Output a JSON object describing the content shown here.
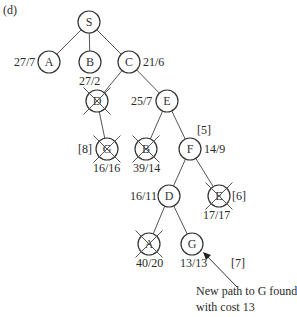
{
  "panel_label": "(d)",
  "nodes": [
    {
      "id": "S",
      "letter": "S",
      "x": 89,
      "y": 22,
      "crossed": false,
      "label": ""
    },
    {
      "id": "A1",
      "letter": "A",
      "x": 49,
      "y": 62,
      "crossed": false,
      "label": "27/7"
    },
    {
      "id": "B1",
      "letter": "B",
      "x": 90,
      "y": 62,
      "crossed": false,
      "label": "27/2"
    },
    {
      "id": "C1",
      "letter": "C",
      "x": 129,
      "y": 62,
      "crossed": false,
      "label": "21/6"
    },
    {
      "id": "D1",
      "letter": "D",
      "x": 97,
      "y": 101,
      "crossed": true,
      "label": ""
    },
    {
      "id": "E1",
      "letter": "E",
      "x": 167,
      "y": 101,
      "crossed": false,
      "label": "25/7"
    },
    {
      "id": "G1",
      "letter": "G",
      "x": 107,
      "y": 149,
      "crossed": true,
      "label": "16/16"
    },
    {
      "id": "B2",
      "letter": "B",
      "x": 146,
      "y": 149,
      "crossed": true,
      "label": "39/14"
    },
    {
      "id": "F1",
      "letter": "F",
      "x": 190,
      "y": 149,
      "crossed": false,
      "label": "14/9"
    },
    {
      "id": "D2",
      "letter": "D",
      "x": 169,
      "y": 196,
      "crossed": false,
      "label": "16/11"
    },
    {
      "id": "E2",
      "letter": "E",
      "x": 219,
      "y": 196,
      "crossed": true,
      "label": "17/17"
    },
    {
      "id": "A2",
      "letter": "A",
      "x": 149,
      "y": 244,
      "crossed": true,
      "label": "40/20"
    },
    {
      "id": "G2",
      "letter": "G",
      "x": 192,
      "y": 244,
      "crossed": false,
      "label": "13/13"
    }
  ],
  "edges": [
    [
      "S",
      "A1"
    ],
    [
      "S",
      "B1"
    ],
    [
      "S",
      "C1"
    ],
    [
      "C1",
      "D1"
    ],
    [
      "C1",
      "E1"
    ],
    [
      "D1",
      "G1"
    ],
    [
      "E1",
      "B2"
    ],
    [
      "E1",
      "F1"
    ],
    [
      "F1",
      "D2"
    ],
    [
      "F1",
      "E2"
    ],
    [
      "D2",
      "A2"
    ],
    [
      "D2",
      "G2"
    ]
  ],
  "labels": {
    "A1": "27/7",
    "B1": "27/2",
    "C1": "21/6",
    "E1": "25/7",
    "G1_step": "[8]",
    "G1": "16/16",
    "B2": "39/14",
    "F1_step": "[5]",
    "F1": "14/9",
    "D2": "16/11",
    "E2_step": "[6]",
    "E2": "17/17",
    "A2": "40/20",
    "G2": "13/13",
    "G2_step": "[7]"
  },
  "annotation": {
    "line1": "New path to G found,",
    "line2": "with cost 13"
  }
}
